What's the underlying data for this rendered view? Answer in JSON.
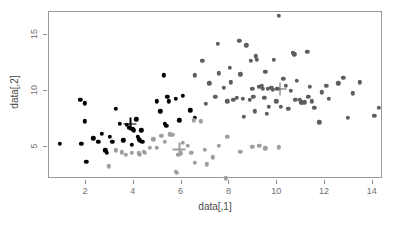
{
  "chart_data": {
    "type": "scatter",
    "title": "",
    "xlabel": "data[,1]",
    "ylabel": "data[,2]",
    "xlim": [
      0.6,
      14.6
    ],
    "ylim": [
      1.6,
      16.9
    ],
    "xticks": [
      2,
      4,
      6,
      8,
      10,
      12,
      14
    ],
    "yticks": [
      5,
      10,
      15
    ],
    "grid": false,
    "legend": "none",
    "annotation": "Three k-means clusters with centroid crosses",
    "series": [
      {
        "name": "cluster-1",
        "color": "#000000",
        "marker": "filled-circle",
        "points": [
          [
            0.95,
            5.2
          ],
          [
            1.8,
            9.1
          ],
          [
            1.85,
            5.2
          ],
          [
            2.0,
            8.8
          ],
          [
            2.0,
            7.2
          ],
          [
            2.05,
            3.6
          ],
          [
            2.35,
            5.7
          ],
          [
            2.55,
            5.4
          ],
          [
            2.7,
            6.1
          ],
          [
            2.85,
            4.6
          ],
          [
            2.9,
            4.4
          ],
          [
            3.05,
            5.8
          ],
          [
            3.15,
            5.4
          ],
          [
            3.3,
            8.3
          ],
          [
            3.45,
            7.0
          ],
          [
            3.6,
            5.5
          ],
          [
            3.75,
            6.9
          ],
          [
            3.85,
            6.65
          ],
          [
            3.95,
            5.1
          ],
          [
            4.0,
            6.5
          ],
          [
            4.05,
            6.4
          ],
          [
            4.15,
            7.4
          ],
          [
            4.2,
            5.8
          ],
          [
            4.25,
            5.6
          ],
          [
            4.3,
            5.5
          ],
          [
            4.35,
            6.4
          ],
          [
            4.4,
            5.35
          ],
          [
            5.0,
            9.0
          ],
          [
            5.15,
            8.1
          ],
          [
            5.3,
            11.3
          ],
          [
            5.35,
            7.0
          ],
          [
            5.4,
            6.8
          ],
          [
            5.45,
            9.4
          ],
          [
            5.5,
            9.0
          ],
          [
            5.8,
            9.2
          ],
          [
            5.95,
            7.3
          ],
          [
            6.1,
            9.5
          ],
          [
            6.4,
            8.2
          ],
          [
            6.6,
            7.5
          ]
        ]
      },
      {
        "name": "cluster-2",
        "color": "#9e9e9e",
        "marker": "filled-circle",
        "points": [
          [
            3.0,
            3.2
          ],
          [
            3.3,
            4.6
          ],
          [
            3.55,
            4.45
          ],
          [
            3.7,
            4.2
          ],
          [
            3.95,
            4.4
          ],
          [
            4.25,
            4.35
          ],
          [
            4.3,
            4.2
          ],
          [
            4.45,
            4.5
          ],
          [
            4.5,
            4.4
          ],
          [
            4.7,
            4.85
          ],
          [
            4.85,
            5.6
          ],
          [
            5.0,
            4.85
          ],
          [
            5.2,
            5.9
          ],
          [
            5.35,
            5.35
          ],
          [
            5.55,
            6.05
          ],
          [
            5.6,
            6.0
          ],
          [
            5.65,
            6.0
          ],
          [
            5.8,
            2.7
          ],
          [
            5.85,
            2.6
          ],
          [
            5.9,
            4.2
          ],
          [
            6.0,
            4.35
          ],
          [
            6.1,
            5.3
          ],
          [
            6.3,
            5.0
          ],
          [
            6.45,
            4.4
          ],
          [
            6.55,
            7.3
          ],
          [
            6.6,
            3.5
          ],
          [
            6.85,
            7.2
          ],
          [
            7.0,
            4.65
          ],
          [
            7.1,
            3.35
          ],
          [
            7.35,
            4.0
          ],
          [
            7.6,
            5.0
          ],
          [
            7.9,
            2.1
          ],
          [
            7.95,
            5.8
          ],
          [
            8.5,
            4.5
          ],
          [
            9.0,
            4.95
          ],
          [
            9.3,
            5.0
          ],
          [
            9.55,
            4.8
          ],
          [
            10.1,
            4.9
          ]
        ]
      },
      {
        "name": "cluster-3",
        "color": "#5e5e5e",
        "marker": "filled-circle",
        "points": [
          [
            6.6,
            11.3
          ],
          [
            6.9,
            12.6
          ],
          [
            7.05,
            8.75
          ],
          [
            7.2,
            10.6
          ],
          [
            7.45,
            9.4
          ],
          [
            7.55,
            14.1
          ],
          [
            7.6,
            11.5
          ],
          [
            7.8,
            10.2
          ],
          [
            7.95,
            9.0
          ],
          [
            8.05,
            12.0
          ],
          [
            8.1,
            10.7
          ],
          [
            8.2,
            9.1
          ],
          [
            8.35,
            9.3
          ],
          [
            8.45,
            14.4
          ],
          [
            8.5,
            11.4
          ],
          [
            8.6,
            9.2
          ],
          [
            8.65,
            7.6
          ],
          [
            8.75,
            14.0
          ],
          [
            8.9,
            9.1
          ],
          [
            8.95,
            12.6
          ],
          [
            9.0,
            10.1
          ],
          [
            9.05,
            9.4
          ],
          [
            9.1,
            8.1
          ],
          [
            9.15,
            13.0
          ],
          [
            9.2,
            12.7
          ],
          [
            9.3,
            10.3
          ],
          [
            9.4,
            10.4
          ],
          [
            9.45,
            10.1
          ],
          [
            9.5,
            9.3
          ],
          [
            9.55,
            11.6
          ],
          [
            9.6,
            7.9
          ],
          [
            9.65,
            10.1
          ],
          [
            9.7,
            8.5
          ],
          [
            9.8,
            10.2
          ],
          [
            9.85,
            10.0
          ],
          [
            9.9,
            12.7
          ],
          [
            10.0,
            9.0
          ],
          [
            10.05,
            10.1
          ],
          [
            10.1,
            16.6
          ],
          [
            10.2,
            8.5
          ],
          [
            10.3,
            11.0
          ],
          [
            10.4,
            10.4
          ],
          [
            10.5,
            8.3
          ],
          [
            10.6,
            9.95
          ],
          [
            10.7,
            13.3
          ],
          [
            10.75,
            13.2
          ],
          [
            10.8,
            9.1
          ],
          [
            10.85,
            10.8
          ],
          [
            11.0,
            9.1
          ],
          [
            11.05,
            8.9
          ],
          [
            11.1,
            8.85
          ],
          [
            11.2,
            8.9
          ],
          [
            11.3,
            13.4
          ],
          [
            11.35,
            9.4
          ],
          [
            11.4,
            10.3
          ],
          [
            11.5,
            9.0
          ],
          [
            11.6,
            8.4
          ],
          [
            11.8,
            7.1
          ],
          [
            11.9,
            9.8
          ],
          [
            12.1,
            10.4
          ],
          [
            12.2,
            9.2
          ],
          [
            12.6,
            10.6
          ],
          [
            12.8,
            11.1
          ],
          [
            13.0,
            7.5
          ],
          [
            13.2,
            9.7
          ],
          [
            13.5,
            10.7
          ],
          [
            14.1,
            7.7
          ],
          [
            14.3,
            8.4
          ]
        ]
      }
    ],
    "centroids": [
      {
        "name": "centroid-cluster-1",
        "color": "#000000",
        "x": 3.9,
        "y": 7.0
      },
      {
        "name": "centroid-cluster-2",
        "color": "#9e9e9e",
        "x": 5.95,
        "y": 4.7
      },
      {
        "name": "centroid-cluster-3",
        "color": "#5e5e5e",
        "x": 10.15,
        "y": 10.1
      }
    ]
  },
  "axes": {
    "x_title": "data[,1]",
    "y_title": "data[,2]",
    "x_tick_labels": [
      "2",
      "4",
      "6",
      "8",
      "10",
      "12",
      "14"
    ],
    "y_tick_labels": [
      "5",
      "10",
      "15"
    ],
    "frame_color": "#9a9a9a",
    "tick_color": "#8d8d8d",
    "label_color": "#6f6f6f"
  }
}
